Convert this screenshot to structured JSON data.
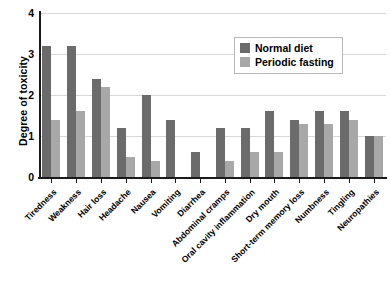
{
  "chart_data": {
    "type": "bar",
    "title": "",
    "xlabel": "",
    "ylabel": "Degree of toxicity",
    "ylim": [
      0,
      4
    ],
    "yticks": [
      0,
      1,
      2,
      3,
      4
    ],
    "grid": true,
    "legend_position": "top-right",
    "categories": [
      "Tiredness",
      "Weakness",
      "Hair loss",
      "Headache",
      "Nausea",
      "Vomiting",
      "Diarrhea",
      "Abdominal cramps",
      "Oral cavity inflammation",
      "Dry mouth",
      "Short-term memory loss",
      "Numbness",
      "Tingling",
      "Neuropathies"
    ],
    "series": [
      {
        "name": "Normal diet",
        "color": "#6b6b6b",
        "values": [
          3.2,
          3.2,
          2.4,
          1.2,
          2.0,
          1.4,
          0.6,
          1.2,
          1.2,
          1.6,
          1.4,
          1.6,
          1.6,
          1.0
        ]
      },
      {
        "name": "Periodic fasting",
        "color": "#a8a8a8",
        "values": [
          1.4,
          1.6,
          2.2,
          0.5,
          0.4,
          0,
          0,
          0.4,
          0.6,
          0.6,
          1.3,
          1.3,
          1.4,
          1.0
        ]
      }
    ]
  }
}
